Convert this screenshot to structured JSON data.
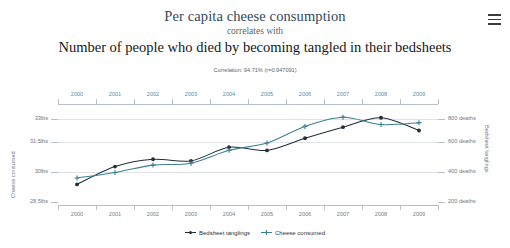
{
  "header": {
    "title_primary": "Per capita cheese consumption",
    "connector": "correlates with",
    "title_secondary": "Number of people who died by becoming tangled in their bedsheets",
    "correlation_text": "Correlation: 94.71% (r=0.947091)",
    "menu_icon": "hamburger-menu-icon"
  },
  "legend": {
    "items": [
      {
        "label": "Bedsheet tanglings",
        "color": "#212d3b",
        "marker": "circle"
      },
      {
        "label": "Cheese consumed",
        "color": "#3d7f96",
        "marker": "plus"
      }
    ]
  },
  "axes": {
    "left_title": "Cheese consumed",
    "right_title": "Bedsheet tanglings",
    "left_ticks": [
      "33lbs",
      "31.5lbs",
      "30lbs",
      "28.5lbs"
    ],
    "right_ticks": [
      "800 deaths",
      "600 deaths",
      "400 deaths",
      "200 deaths"
    ],
    "top_years": [
      "2000",
      "2001",
      "2002",
      "2003",
      "2004",
      "2005",
      "2006",
      "2007",
      "2008",
      "2009"
    ],
    "bottom_years": [
      "2000",
      "2001",
      "2002",
      "2003",
      "2004",
      "2005",
      "2006",
      "2007",
      "2008",
      "2009"
    ]
  },
  "colors": {
    "title_primary": "#33475b",
    "title_secondary": "#15181c",
    "cheese_series": "#3d7f96",
    "bedsheet_series": "#212d3b",
    "gridline": "#dfe3e6",
    "axis": "#b9bfc4",
    "top_year_label": "#5b8fa8",
    "bottom_year_label": "#777f86"
  },
  "chart_data": {
    "type": "line",
    "title": "Per capita cheese consumption correlates with Number of people who died by becoming tangled in their bedsheets",
    "subtitle": "Correlation: 94.71% (r=0.947091)",
    "x": [
      "2000",
      "2001",
      "2002",
      "2003",
      "2004",
      "2005",
      "2006",
      "2007",
      "2008",
      "2009"
    ],
    "xlabel": "",
    "grid": true,
    "legend_position": "bottom",
    "series": [
      {
        "name": "Cheese consumed",
        "color": "#3d7f96",
        "axis": "left",
        "unit": "lbs",
        "ylabel": "Cheese consumed",
        "ylim": [
          28.5,
          33.0
        ],
        "yticks": [
          28.5,
          30.0,
          31.5,
          33.0
        ],
        "ytick_labels": [
          "28.5lbs",
          "30lbs",
          "31.5lbs",
          "33lbs"
        ],
        "values": [
          29.8,
          30.1,
          30.5,
          30.6,
          31.3,
          31.7,
          32.6,
          33.1,
          32.7,
          32.8
        ]
      },
      {
        "name": "Bedsheet tanglings",
        "color": "#212d3b",
        "axis": "right",
        "unit": "deaths",
        "ylabel": "Bedsheet tanglings",
        "ylim": [
          200,
          800
        ],
        "yticks": [
          200,
          400,
          600,
          800
        ],
        "ytick_labels": [
          "200 deaths",
          "400 deaths",
          "600 deaths",
          "800 deaths"
        ],
        "values": [
          327,
          456,
          509,
          497,
          596,
          573,
          661,
          741,
          809,
          717
        ]
      }
    ]
  }
}
